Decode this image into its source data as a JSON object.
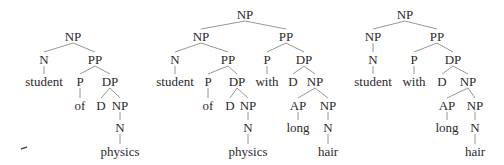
{
  "figure": {
    "width": 504,
    "height": 165,
    "text_color": "#2a2a2a",
    "edge_color": "#8a8a8a"
  },
  "trees": [
    {
      "id": "tree-1",
      "nodes": [
        {
          "id": "t1-np",
          "label": "NP",
          "x": 73,
          "y": 37
        },
        {
          "id": "t1-n",
          "label": "N",
          "x": 44,
          "y": 60
        },
        {
          "id": "t1-pp",
          "label": "PP",
          "x": 95,
          "y": 60
        },
        {
          "id": "t1-student",
          "label": "student",
          "x": 44,
          "y": 82,
          "leaf": true
        },
        {
          "id": "t1-p",
          "label": "P",
          "x": 80,
          "y": 82
        },
        {
          "id": "t1-dp",
          "label": "DP",
          "x": 110,
          "y": 82
        },
        {
          "id": "t1-of",
          "label": "of",
          "x": 80,
          "y": 106,
          "leaf": true
        },
        {
          "id": "t1-d",
          "label": "D",
          "x": 101,
          "y": 106
        },
        {
          "id": "t1-np2",
          "label": "NP",
          "x": 120,
          "y": 106
        },
        {
          "id": "t1-n2",
          "label": "N",
          "x": 120,
          "y": 128
        },
        {
          "id": "t1-physics",
          "label": "physics",
          "x": 120,
          "y": 152,
          "leaf": true
        }
      ],
      "edges": [
        [
          "t1-np",
          "t1-n"
        ],
        [
          "t1-np",
          "t1-pp"
        ],
        [
          "t1-n",
          "t1-student"
        ],
        [
          "t1-pp",
          "t1-p"
        ],
        [
          "t1-pp",
          "t1-dp"
        ],
        [
          "t1-p",
          "t1-of"
        ],
        [
          "t1-dp",
          "t1-d"
        ],
        [
          "t1-dp",
          "t1-np2"
        ],
        [
          "t1-np2",
          "t1-n2"
        ],
        [
          "t1-n2",
          "t1-physics"
        ]
      ]
    },
    {
      "id": "tree-2",
      "nodes": [
        {
          "id": "t2-np",
          "label": "NP",
          "x": 245,
          "y": 15
        },
        {
          "id": "t2-npl",
          "label": "NP",
          "x": 201,
          "y": 37
        },
        {
          "id": "t2-ppr",
          "label": "PP",
          "x": 286,
          "y": 37
        },
        {
          "id": "t2-n",
          "label": "N",
          "x": 175,
          "y": 60
        },
        {
          "id": "t2-pp",
          "label": "PP",
          "x": 228,
          "y": 60
        },
        {
          "id": "t2-p2",
          "label": "P",
          "x": 267,
          "y": 60
        },
        {
          "id": "t2-dp2",
          "label": "DP",
          "x": 304,
          "y": 60
        },
        {
          "id": "t2-student",
          "label": "student",
          "x": 175,
          "y": 82,
          "leaf": true
        },
        {
          "id": "t2-p",
          "label": "P",
          "x": 208,
          "y": 82
        },
        {
          "id": "t2-dp",
          "label": "DP",
          "x": 237,
          "y": 82
        },
        {
          "id": "t2-with",
          "label": "with",
          "x": 267,
          "y": 82,
          "leaf": true
        },
        {
          "id": "t2-d2",
          "label": "D",
          "x": 293,
          "y": 82
        },
        {
          "id": "t2-np3",
          "label": "NP",
          "x": 315,
          "y": 82
        },
        {
          "id": "t2-of",
          "label": "of",
          "x": 208,
          "y": 106,
          "leaf": true
        },
        {
          "id": "t2-d",
          "label": "D",
          "x": 230,
          "y": 106
        },
        {
          "id": "t2-np2",
          "label": "NP",
          "x": 248,
          "y": 106
        },
        {
          "id": "t2-ap",
          "label": "AP",
          "x": 298,
          "y": 106
        },
        {
          "id": "t2-np4",
          "label": "NP",
          "x": 328,
          "y": 106
        },
        {
          "id": "t2-n2",
          "label": "N",
          "x": 248,
          "y": 128
        },
        {
          "id": "t2-long",
          "label": "long",
          "x": 298,
          "y": 128,
          "leaf": true
        },
        {
          "id": "t2-n3",
          "label": "N",
          "x": 328,
          "y": 128
        },
        {
          "id": "t2-physics",
          "label": "physics",
          "x": 248,
          "y": 152,
          "leaf": true
        },
        {
          "id": "t2-hair",
          "label": "hair",
          "x": 328,
          "y": 152,
          "leaf": true
        }
      ],
      "edges": [
        [
          "t2-np",
          "t2-npl"
        ],
        [
          "t2-np",
          "t2-ppr"
        ],
        [
          "t2-npl",
          "t2-n"
        ],
        [
          "t2-npl",
          "t2-pp"
        ],
        [
          "t2-ppr",
          "t2-p2"
        ],
        [
          "t2-ppr",
          "t2-dp2"
        ],
        [
          "t2-n",
          "t2-student"
        ],
        [
          "t2-pp",
          "t2-p"
        ],
        [
          "t2-pp",
          "t2-dp"
        ],
        [
          "t2-p2",
          "t2-with"
        ],
        [
          "t2-dp2",
          "t2-d2"
        ],
        [
          "t2-dp2",
          "t2-np3"
        ],
        [
          "t2-p",
          "t2-of"
        ],
        [
          "t2-dp",
          "t2-d"
        ],
        [
          "t2-dp",
          "t2-np2"
        ],
        [
          "t2-np3",
          "t2-ap"
        ],
        [
          "t2-np3",
          "t2-np4"
        ],
        [
          "t2-np2",
          "t2-n2"
        ],
        [
          "t2-ap",
          "t2-long"
        ],
        [
          "t2-np4",
          "t2-n3"
        ],
        [
          "t2-n2",
          "t2-physics"
        ],
        [
          "t2-n3",
          "t2-hair"
        ]
      ]
    },
    {
      "id": "tree-3",
      "nodes": [
        {
          "id": "t3-np",
          "label": "NP",
          "x": 405,
          "y": 15
        },
        {
          "id": "t3-npl",
          "label": "NP",
          "x": 373,
          "y": 37
        },
        {
          "id": "t3-pp",
          "label": "PP",
          "x": 437,
          "y": 37
        },
        {
          "id": "t3-n",
          "label": "N",
          "x": 373,
          "y": 60
        },
        {
          "id": "t3-p",
          "label": "P",
          "x": 414,
          "y": 60
        },
        {
          "id": "t3-dp",
          "label": "DP",
          "x": 453,
          "y": 60
        },
        {
          "id": "t3-student",
          "label": "student",
          "x": 373,
          "y": 82,
          "leaf": true
        },
        {
          "id": "t3-with",
          "label": "with",
          "x": 414,
          "y": 82,
          "leaf": true
        },
        {
          "id": "t3-d",
          "label": "D",
          "x": 442,
          "y": 82
        },
        {
          "id": "t3-np2",
          "label": "NP",
          "x": 468,
          "y": 82
        },
        {
          "id": "t3-ap",
          "label": "AP",
          "x": 447,
          "y": 106
        },
        {
          "id": "t3-np3",
          "label": "NP",
          "x": 475,
          "y": 106
        },
        {
          "id": "t3-long",
          "label": "long",
          "x": 447,
          "y": 128,
          "leaf": true
        },
        {
          "id": "t3-n2",
          "label": "N",
          "x": 475,
          "y": 128
        },
        {
          "id": "t3-hair",
          "label": "hair",
          "x": 475,
          "y": 152,
          "leaf": true
        }
      ],
      "edges": [
        [
          "t3-np",
          "t3-npl"
        ],
        [
          "t3-np",
          "t3-pp"
        ],
        [
          "t3-npl",
          "t3-n"
        ],
        [
          "t3-pp",
          "t3-p"
        ],
        [
          "t3-pp",
          "t3-dp"
        ],
        [
          "t3-n",
          "t3-student"
        ],
        [
          "t3-p",
          "t3-with"
        ],
        [
          "t3-dp",
          "t3-d"
        ],
        [
          "t3-dp",
          "t3-np2"
        ],
        [
          "t3-np2",
          "t3-ap"
        ],
        [
          "t3-np2",
          "t3-np3"
        ],
        [
          "t3-ap",
          "t3-long"
        ],
        [
          "t3-np3",
          "t3-n2"
        ],
        [
          "t3-n2",
          "t3-hair"
        ]
      ]
    }
  ],
  "artifacts": [
    {
      "type": "dash",
      "x1": 21,
      "y1": 149,
      "x2": 27,
      "y2": 147
    }
  ]
}
